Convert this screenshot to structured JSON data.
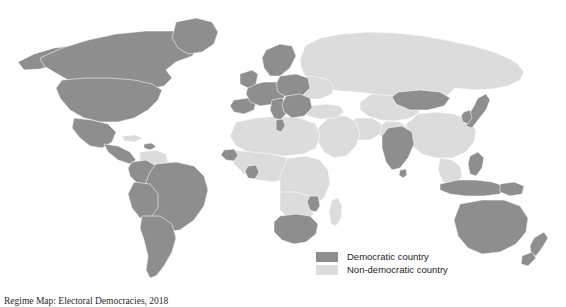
{
  "figure": {
    "type": "choropleth-world-map",
    "background_color": "#ffffff",
    "caption": "Regime Map: Electoral Democracies, 2018"
  },
  "colors": {
    "democratic": "#8e8e8e",
    "non_democratic": "#dcdcdc",
    "ocean": "#ffffff",
    "border": "#ffffff",
    "text": "#1d1d1d"
  },
  "legend": {
    "position": "bottom-right",
    "items": [
      {
        "label": "Democratic country",
        "color_key": "democratic",
        "swatch": "#8e8e8e"
      },
      {
        "label": "Non-democratic country",
        "color_key": "non_democratic",
        "swatch": "#dcdcdc"
      }
    ]
  },
  "map_data": {
    "projection": "robinson",
    "categories": [
      "Democratic country",
      "Non-democratic country"
    ],
    "regions": [
      {
        "name": "Canada",
        "category": "Democratic country"
      },
      {
        "name": "Greenland",
        "category": "Democratic country"
      },
      {
        "name": "United States",
        "category": "Democratic country"
      },
      {
        "name": "Alaska",
        "category": "Democratic country"
      },
      {
        "name": "Mexico",
        "category": "Democratic country"
      },
      {
        "name": "Central America",
        "category": "Democratic country"
      },
      {
        "name": "Caribbean",
        "category": "Democratic country"
      },
      {
        "name": "Cuba",
        "category": "Non-democratic country"
      },
      {
        "name": "Colombia",
        "category": "Democratic country"
      },
      {
        "name": "Venezuela",
        "category": "Non-democratic country"
      },
      {
        "name": "Guyanas",
        "category": "Democratic country"
      },
      {
        "name": "Brazil",
        "category": "Democratic country"
      },
      {
        "name": "Peru",
        "category": "Democratic country"
      },
      {
        "name": "Bolivia",
        "category": "Democratic country"
      },
      {
        "name": "Chile",
        "category": "Democratic country"
      },
      {
        "name": "Argentina",
        "category": "Democratic country"
      },
      {
        "name": "Western Europe",
        "category": "Democratic country"
      },
      {
        "name": "Scandinavia",
        "category": "Democratic country"
      },
      {
        "name": "United Kingdom",
        "category": "Democratic country"
      },
      {
        "name": "Iberia",
        "category": "Democratic country"
      },
      {
        "name": "Italy",
        "category": "Democratic country"
      },
      {
        "name": "Central Europe",
        "category": "Democratic country"
      },
      {
        "name": "Balkans",
        "category": "Democratic country"
      },
      {
        "name": "Greece",
        "category": "Democratic country"
      },
      {
        "name": "Baltics",
        "category": "Democratic country"
      },
      {
        "name": "Ukraine",
        "category": "Non-democratic country"
      },
      {
        "name": "Belarus",
        "category": "Non-democratic country"
      },
      {
        "name": "Russia",
        "category": "Non-democratic country"
      },
      {
        "name": "Turkey",
        "category": "Non-democratic country"
      },
      {
        "name": "Middle East",
        "category": "Non-democratic country"
      },
      {
        "name": "North Africa",
        "category": "Non-democratic country"
      },
      {
        "name": "Tunisia",
        "category": "Democratic country"
      },
      {
        "name": "Senegal",
        "category": "Democratic country"
      },
      {
        "name": "Ghana",
        "category": "Democratic country"
      },
      {
        "name": "West Africa",
        "category": "Non-democratic country"
      },
      {
        "name": "Central Africa",
        "category": "Non-democratic country"
      },
      {
        "name": "East Africa",
        "category": "Non-democratic country"
      },
      {
        "name": "Namibia",
        "category": "Democratic country"
      },
      {
        "name": "Botswana",
        "category": "Democratic country"
      },
      {
        "name": "South Africa",
        "category": "Democratic country"
      },
      {
        "name": "Madagascar",
        "category": "Non-democratic country"
      },
      {
        "name": "Central Asia",
        "category": "Non-democratic country"
      },
      {
        "name": "Iran",
        "category": "Non-democratic country"
      },
      {
        "name": "Pakistan",
        "category": "Non-democratic country"
      },
      {
        "name": "India",
        "category": "Democratic country"
      },
      {
        "name": "Sri Lanka",
        "category": "Democratic country"
      },
      {
        "name": "China",
        "category": "Non-democratic country"
      },
      {
        "name": "Mongolia",
        "category": "Democratic country"
      },
      {
        "name": "Japan",
        "category": "Democratic country"
      },
      {
        "name": "Korea",
        "category": "Democratic country"
      },
      {
        "name": "Southeast Asia",
        "category": "Non-democratic country"
      },
      {
        "name": "Philippines",
        "category": "Democratic country"
      },
      {
        "name": "Indonesia",
        "category": "Democratic country"
      },
      {
        "name": "Papua New Guinea",
        "category": "Democratic country"
      },
      {
        "name": "Australia",
        "category": "Democratic country"
      },
      {
        "name": "New Zealand",
        "category": "Democratic country"
      }
    ]
  }
}
